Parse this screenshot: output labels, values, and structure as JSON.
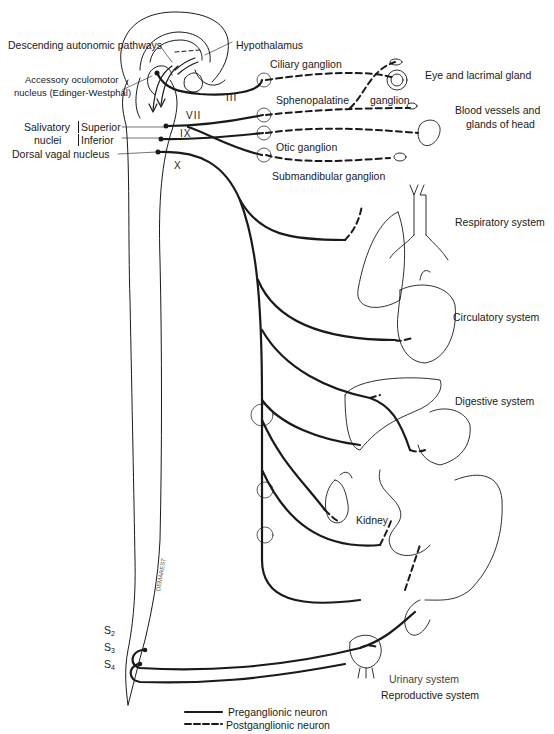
{
  "labels": {
    "descending_pathways": "Descending autonomic pathways",
    "hypothalamus": "Hypothalamus",
    "edinger_westphal_1": "Accessory oculomotor",
    "edinger_westphal_2": "nucleus (Edinger-Westphal)",
    "salivatory_1": "Salivatory",
    "salivatory_2": "nuclei",
    "superior": "Superior",
    "inferior": "Inferior",
    "dorsal_vagal": "Dorsal vagal nucleus",
    "ciliary_ganglion": "Ciliary ganglion",
    "sphenopalatine": "Sphenopalatine",
    "ganglion": "ganglion",
    "otic_ganglion": "Otic ganglion",
    "submandibular_ganglion": "Submandibular ganglion",
    "eye_lacrimal": "Eye and lacrimal gland",
    "blood_vessels_1": "Blood vessels and",
    "blood_vessels_2": "glands of head",
    "respiratory": "Respiratory system",
    "circulatory": "Circulatory system",
    "digestive": "Digestive system",
    "kidney": "Kidney",
    "urinary": "Urinary system",
    "reproductive": "Reproductive system",
    "signature": "DEMAREST"
  },
  "cranial_nerves": {
    "III": "III",
    "VII": "VII",
    "IX": "IX",
    "X": "X"
  },
  "sacral_segments": {
    "s2": {
      "letter": "S",
      "num": "2"
    },
    "s3": {
      "letter": "S",
      "num": "3"
    },
    "s4": {
      "letter": "S",
      "num": "4"
    }
  },
  "legend": {
    "preganglionic": "Preganglionic neuron",
    "postganglionic": "Postganglionic neuron"
  },
  "colors": {
    "ink": "#1a1a1a",
    "background": "#ffffff"
  }
}
